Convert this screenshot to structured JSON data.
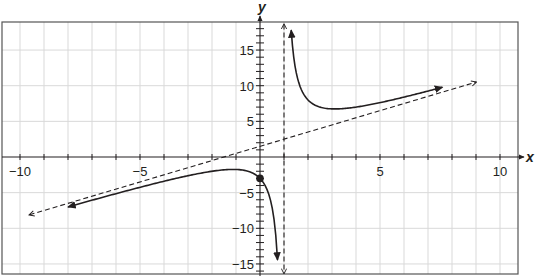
{
  "chart_data": {
    "type": "line",
    "title": "",
    "xlabel": "x",
    "ylabel": "y",
    "xlim": [
      -10.8,
      10.7
    ],
    "ylim": [
      -16.3,
      19
    ],
    "grid": true,
    "x_ticks": [
      -10,
      -9,
      -8,
      -7,
      -6,
      -5,
      -4,
      -3,
      -2,
      -1,
      1,
      2,
      3,
      4,
      5,
      6,
      7,
      8,
      9,
      10
    ],
    "x_tick_labels": [
      {
        "value": -10,
        "label": "−10"
      },
      {
        "value": -5,
        "label": "−5"
      },
      {
        "value": 5,
        "label": "5"
      },
      {
        "value": 10,
        "label": "10"
      }
    ],
    "y_tick_labels": [
      {
        "value": 15,
        "label": "15"
      },
      {
        "value": 10,
        "label": "10"
      },
      {
        "value": 5,
        "label": "5"
      },
      {
        "value": -5,
        "label": "−5"
      },
      {
        "value": -10,
        "label": "−10"
      },
      {
        "value": -15,
        "label": "−15"
      }
    ],
    "series": [
      {
        "name": "rational function (left branch)",
        "style": "solid",
        "arrow_at_ends": true,
        "points": [
          [
            -8,
            -7.0
          ],
          [
            -6,
            -5.1
          ],
          [
            -4,
            -3.4
          ],
          [
            -2,
            -2.0
          ],
          [
            -1.12,
            -1.74
          ],
          [
            -0.5,
            -2.0
          ],
          [
            0,
            -3.0
          ],
          [
            0.4,
            -5.6
          ],
          [
            0.6,
            -9.2
          ],
          [
            0.73,
            -14.4
          ]
        ]
      },
      {
        "name": "rational function (right branch)",
        "style": "solid",
        "arrow_at_ends": true,
        "points": [
          [
            1.3,
            17.8
          ],
          [
            1.5,
            12.0
          ],
          [
            2,
            8.0
          ],
          [
            3.12,
            6.74
          ],
          [
            4,
            7.0
          ],
          [
            5,
            7.6
          ],
          [
            6,
            8.4
          ],
          [
            7.6,
            9.78
          ]
        ]
      },
      {
        "name": "oblique asymptote",
        "style": "dashed",
        "arrow_at_ends": true,
        "points": [
          [
            -9.6,
            -8.1
          ],
          [
            9,
            10.5
          ]
        ]
      },
      {
        "name": "vertical asymptote",
        "style": "dashed",
        "arrow_at_ends": true,
        "points": [
          [
            1,
            18.6
          ],
          [
            1,
            -16.3
          ]
        ]
      }
    ],
    "annotations": [
      {
        "type": "point",
        "x": 0,
        "y": -3,
        "filled": true
      }
    ]
  },
  "axes": {
    "x_label": "x",
    "y_label": "y"
  }
}
